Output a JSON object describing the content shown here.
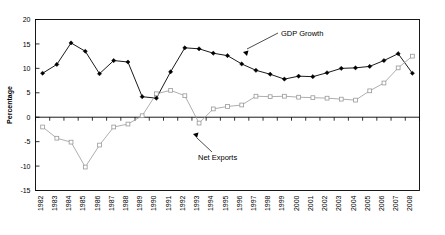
{
  "chart_data": {
    "type": "line",
    "title": "",
    "xlabel": "",
    "ylabel": "Percentage",
    "ylim": [
      -15,
      20
    ],
    "yticks": [
      20,
      15,
      10,
      5,
      0,
      -5,
      -10,
      -15
    ],
    "ytick_labels": [
      "20",
      "15",
      "10",
      "5",
      "0",
      "-5",
      "-10",
      "-15"
    ],
    "grid": false,
    "legend_position": "inline-annotations",
    "categories": [
      1982,
      1983,
      1984,
      1985,
      1986,
      1987,
      1988,
      1989,
      1990,
      1991,
      1992,
      1993,
      1994,
      1995,
      1996,
      1997,
      1998,
      1999,
      2000,
      2001,
      2002,
      2003,
      2004,
      2005,
      2006,
      2007,
      2008
    ],
    "xtick_labels": [
      "1982",
      "1983",
      "1984",
      "1985",
      "1986",
      "1987",
      "1988",
      "1989",
      "1990",
      "1991",
      "1992",
      "1993",
      "1994",
      "1995",
      "1996",
      "1997",
      "1998",
      "1999",
      "2000",
      "2001",
      "2002",
      "2003",
      "2004",
      "2005",
      "2006",
      "2007",
      "2008"
    ],
    "series": [
      {
        "name": "GDP Growth",
        "marker": "filled-diamond",
        "color": "#000000",
        "values": [
          9.0,
          10.8,
          15.2,
          13.5,
          8.9,
          11.6,
          11.3,
          4.2,
          3.9,
          9.3,
          14.2,
          14.0,
          13.1,
          12.6,
          10.9,
          9.6,
          8.8,
          7.8,
          8.4,
          8.3,
          9.1,
          10.0,
          10.1,
          10.4,
          11.6,
          13.0,
          9.0
        ]
      },
      {
        "name": "Net Exports",
        "marker": "open-square",
        "color": "#999999",
        "values": [
          -2.0,
          -4.3,
          -5.1,
          -10.2,
          -5.7,
          -2.0,
          -1.4,
          0.3,
          4.8,
          5.5,
          4.4,
          -1.2,
          1.7,
          2.2,
          2.5,
          4.3,
          4.2,
          4.3,
          4.1,
          4.0,
          3.9,
          3.7,
          3.5,
          5.4,
          7.0,
          10.1,
          12.5
        ]
      }
    ],
    "annotations": [
      {
        "name": "GDP Growth",
        "text": "GDP Growth",
        "points_to_year": 1998
      },
      {
        "name": "Net Exports",
        "text": "Net Exports",
        "points_to_year": 1993
      }
    ]
  }
}
